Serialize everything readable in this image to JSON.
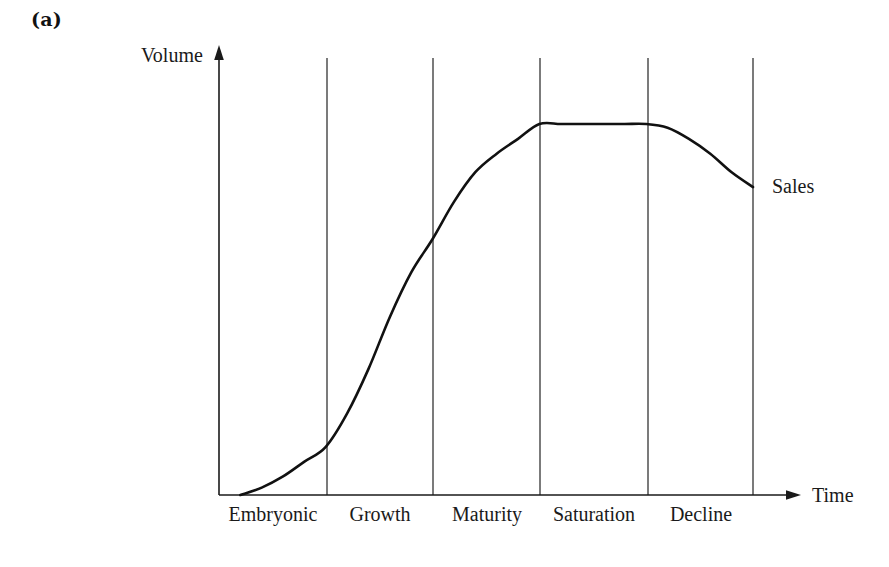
{
  "figure": {
    "panel_label": "(a)",
    "caption_visible": false
  },
  "axes": {
    "y_title": "Volume",
    "x_title": "Time",
    "y_arrow": "arrow-up-icon",
    "x_arrow": "arrow-right-icon"
  },
  "series": [
    {
      "name": "Sales",
      "label": "Sales",
      "color": "#111111"
    }
  ],
  "stages": [
    {
      "label": "Embryonic"
    },
    {
      "label": "Growth"
    },
    {
      "label": "Maturity"
    },
    {
      "label": "Saturation"
    },
    {
      "label": "Decline"
    }
  ],
  "chart_data": {
    "type": "line",
    "title": "",
    "subtitle": "",
    "xlabel": "Time",
    "ylabel": "Volume",
    "xlim": [
      0,
      5
    ],
    "ylim": [
      0,
      1.1
    ],
    "grid": false,
    "legend_position": "right-inline",
    "axis_ticks": false,
    "tick_labels": {
      "x": [
        "Embryonic",
        "Growth",
        "Maturity",
        "Saturation",
        "Decline"
      ],
      "y": []
    },
    "annotations": [
      {
        "text": "Sales",
        "x": 5.0,
        "y": 0.83
      },
      {
        "text": "(a)",
        "x": null,
        "y": null
      }
    ],
    "stage_boundaries": [
      0,
      1,
      2,
      3,
      4,
      5
    ],
    "series": [
      {
        "name": "Sales",
        "x": [
          0.2,
          0.4,
          0.6,
          0.8,
          1.0,
          1.2,
          1.4,
          1.6,
          1.8,
          2.0,
          2.2,
          2.4,
          2.6,
          2.8,
          3.0,
          3.2,
          3.4,
          3.6,
          3.8,
          4.0,
          4.2,
          4.4,
          4.6,
          4.8,
          5.0
        ],
        "values": [
          0.0,
          0.02,
          0.05,
          0.09,
          0.13,
          0.22,
          0.34,
          0.48,
          0.6,
          0.69,
          0.79,
          0.87,
          0.92,
          0.96,
          1.0,
          1.0,
          1.0,
          1.0,
          1.0,
          1.0,
          0.99,
          0.96,
          0.92,
          0.87,
          0.83
        ]
      }
    ]
  },
  "colors": {
    "background": "#ffffff",
    "ink": "#1a1a1a",
    "curve": "#111111"
  }
}
